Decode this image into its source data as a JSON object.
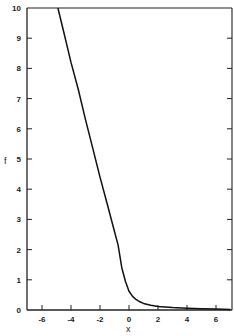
{
  "chart_data": {
    "type": "line",
    "title": "",
    "xlabel": "x",
    "ylabel": "f",
    "xlim": [
      -6.9,
      7.0
    ],
    "ylim": [
      0,
      10
    ],
    "grid": false,
    "xticks": [
      -6,
      -4,
      -2,
      0,
      2,
      4,
      6
    ],
    "xtick_labels": [
      "-6",
      "-4",
      "-2",
      "0",
      "2",
      "4",
      "6"
    ],
    "yticks": [
      0,
      1,
      2,
      3,
      4,
      5,
      6,
      7,
      8,
      9,
      10
    ],
    "ytick_labels": [
      "0",
      "1",
      "2",
      "3",
      "4",
      "5",
      "6",
      "7",
      "8",
      "9",
      "10"
    ],
    "series": [
      {
        "name": "f(x)",
        "color": "#111111",
        "x": [
          -4.9,
          -4.5,
          -4.0,
          -3.5,
          -3.0,
          -2.5,
          -2.0,
          -1.5,
          -1.0,
          -0.75,
          -0.5,
          -0.25,
          0.0,
          0.25,
          0.5,
          0.75,
          1.0,
          1.5,
          2.0,
          2.5,
          3.0,
          4.0,
          5.0,
          6.0,
          7.0
        ],
        "y": [
          10.0,
          9.2,
          8.2,
          7.3,
          6.3,
          5.35,
          4.4,
          3.5,
          2.6,
          2.15,
          1.4,
          0.95,
          0.62,
          0.45,
          0.34,
          0.27,
          0.22,
          0.16,
          0.12,
          0.1,
          0.08,
          0.06,
          0.04,
          0.03,
          0.02
        ]
      }
    ]
  }
}
